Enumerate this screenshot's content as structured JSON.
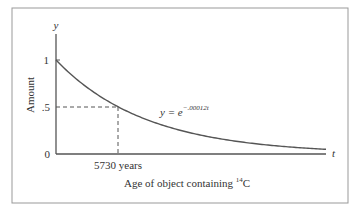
{
  "chart_data": {
    "type": "line",
    "title": "",
    "xlabel": "Age of object containing 14C",
    "xlabel_parts": {
      "prefix": "Age of object containing ",
      "superscript": "14",
      "suffix": "C"
    },
    "ylabel": "Amount",
    "x_axis_symbol": "t",
    "y_axis_symbol": "y",
    "y_ticks": [
      "0",
      ".5",
      "1"
    ],
    "y_tick_values": [
      0,
      0.5,
      1
    ],
    "x_annotation": "5730 years",
    "x_annotation_value": 5730,
    "equation": {
      "lhs": "y = e",
      "exponent": "−.00012t"
    },
    "series": [
      {
        "name": "y = e^(-.00012t)",
        "x": [
          0,
          2865,
          5730,
          8595,
          11460,
          17190,
          22920,
          28650
        ],
        "values": [
          1,
          0.707,
          0.5,
          0.354,
          0.25,
          0.125,
          0.0625,
          0.03
        ]
      }
    ],
    "ylim": [
      0,
      1.2
    ],
    "xlim": [
      0,
      30000
    ],
    "grid": false,
    "half_life_guides": {
      "style": "dashed",
      "y": 0.5,
      "x": 5730
    }
  },
  "colors": {
    "curve": "#555555",
    "axis": "#555555",
    "frame": "#999999"
  }
}
